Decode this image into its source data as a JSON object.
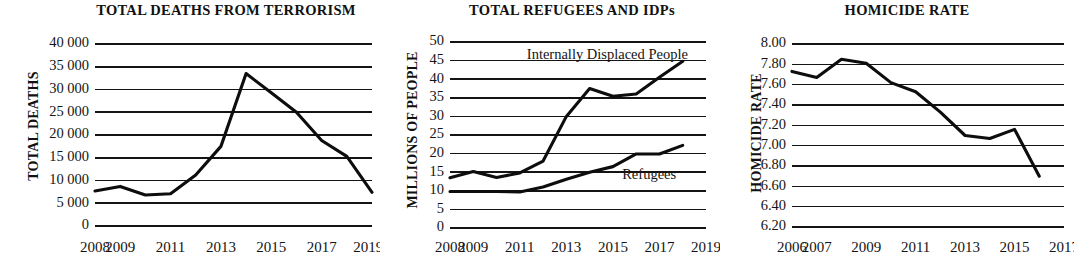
{
  "figure": {
    "panel_count": 3,
    "background_color": "#ffffff",
    "line_color": "#0d0d0d",
    "grid_color": "#141414"
  },
  "chart_data": [
    {
      "type": "line",
      "title": "TOTAL DEATHS FROM TERRORISM",
      "xlabel": "",
      "ylabel": "TOTAL DEATHS",
      "ylim": [
        0,
        40000
      ],
      "ytick_values": [
        0,
        5000,
        10000,
        15000,
        20000,
        25000,
        30000,
        35000,
        40000
      ],
      "ytick_labels": [
        "0",
        "5 000",
        "10 000",
        "15 000",
        "20 000",
        "25 000",
        "30 000",
        "35 000",
        "40 000"
      ],
      "xlim": [
        2008,
        2019
      ],
      "xtick_values": [
        2008,
        2009,
        2011,
        2013,
        2015,
        2017,
        2019
      ],
      "xtick_labels": [
        "2008",
        "2009",
        "2011",
        "2013",
        "2015",
        "2017",
        "2019*"
      ],
      "grid": true,
      "legend": "none",
      "x": [
        2008,
        2009,
        2010,
        2011,
        2012,
        2013,
        2014,
        2015,
        2016,
        2017,
        2018,
        2019
      ],
      "series": [
        {
          "name": "Total deaths",
          "values": [
            7700,
            8700,
            6800,
            7100,
            11200,
            17500,
            33500,
            29300,
            25000,
            18800,
            15300,
            7400
          ]
        }
      ]
    },
    {
      "type": "line",
      "title": "TOTAL REFUGEES AND IDPs",
      "xlabel": "",
      "ylabel": "MILLIONS OF PEOPLE",
      "ylim": [
        0,
        50
      ],
      "ytick_values": [
        0,
        5,
        10,
        15,
        20,
        25,
        30,
        35,
        40,
        45,
        50
      ],
      "ytick_labels": [
        "0",
        "5",
        "10",
        "15",
        "20",
        "25",
        "30",
        "35",
        "40",
        "45",
        "50"
      ],
      "xlim": [
        2008,
        2019
      ],
      "xtick_values": [
        2008,
        2009,
        2011,
        2013,
        2015,
        2017,
        2019
      ],
      "xtick_labels": [
        "2008",
        "2009",
        "2011",
        "2013",
        "2015",
        "2017",
        "2019"
      ],
      "grid": true,
      "legend": "inline-annotation",
      "x": [
        2008,
        2009,
        2010,
        2011,
        2012,
        2013,
        2014,
        2015,
        2016,
        2017,
        2018
      ],
      "series": [
        {
          "name": "Internally Displaced People",
          "label": "Internally Displaced People",
          "values": [
            13.5,
            15.2,
            13.6,
            14.8,
            18.0,
            30.0,
            37.5,
            35.4,
            36.0,
            40.5,
            44.8
          ]
        },
        {
          "name": "Refugees",
          "label": "Refugees",
          "values": [
            9.8,
            9.8,
            9.8,
            9.7,
            11.0,
            13.1,
            15.0,
            16.5,
            19.9,
            19.9,
            22.2
          ]
        }
      ]
    },
    {
      "type": "line",
      "title": "HOMICIDE RATE",
      "xlabel": "",
      "ylabel": "HOMICIDE RATE",
      "ylim": [
        6.2,
        8.0
      ],
      "ytick_values": [
        6.2,
        6.4,
        6.6,
        6.8,
        7.0,
        7.2,
        7.4,
        7.6,
        7.8,
        8.0
      ],
      "ytick_labels": [
        "6.20",
        "6.40",
        "6.60",
        "6.80",
        "7.00",
        "7.20",
        "7.40",
        "7.60",
        "7.80",
        "8.00"
      ],
      "xlim": [
        2006,
        2017
      ],
      "xtick_values": [
        2006,
        2007,
        2009,
        2011,
        2013,
        2015,
        2017
      ],
      "xtick_labels": [
        "2006",
        "2007",
        "2009",
        "2011",
        "2013",
        "2015",
        "2017"
      ],
      "grid": true,
      "legend": "none",
      "x": [
        2006,
        2007,
        2008,
        2009,
        2010,
        2011,
        2012,
        2013,
        2014,
        2015
      ],
      "series": [
        {
          "name": "Homicide rate",
          "values": [
            7.73,
            7.67,
            7.85,
            7.81,
            7.62,
            7.53,
            7.33,
            7.1,
            7.07,
            7.16
          ]
        }
      ],
      "tail_point": {
        "x": 2016,
        "y": 6.7
      }
    }
  ]
}
